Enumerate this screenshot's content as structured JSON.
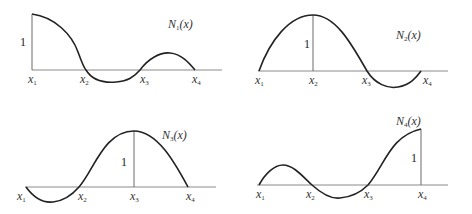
{
  "panels": [
    {
      "name": "N1",
      "label": "N",
      "label_sub": "1",
      "label_tail": "(x)",
      "unit_label": "1",
      "nodes": [
        "x",
        "x",
        "x",
        "x"
      ],
      "node_subs": [
        "1",
        "2",
        "3",
        "4"
      ],
      "peak_at": "x1"
    },
    {
      "name": "N2",
      "label": "N",
      "label_sub": "2",
      "label_tail": "(x)",
      "unit_label": "1",
      "nodes": [
        "x",
        "x",
        "x",
        "x"
      ],
      "node_subs": [
        "1",
        "2",
        "3",
        "4"
      ],
      "peak_at": "x2"
    },
    {
      "name": "N3",
      "label": "N",
      "label_sub": "3",
      "label_tail": "(x)",
      "unit_label": "1",
      "nodes": [
        "x",
        "x",
        "x",
        "x"
      ],
      "node_subs": [
        "1",
        "2",
        "3",
        "4"
      ],
      "peak_at": "x3"
    },
    {
      "name": "N4",
      "label": "N",
      "label_sub": "4",
      "label_tail": "(x)",
      "unit_label": "1",
      "nodes": [
        "x",
        "x",
        "x",
        "x"
      ],
      "node_subs": [
        "1",
        "2",
        "3",
        "4"
      ],
      "peak_at": "x4"
    }
  ],
  "colors": {
    "curve": "#222222",
    "axis": "#8a8a8a",
    "background": "#ffffff"
  }
}
